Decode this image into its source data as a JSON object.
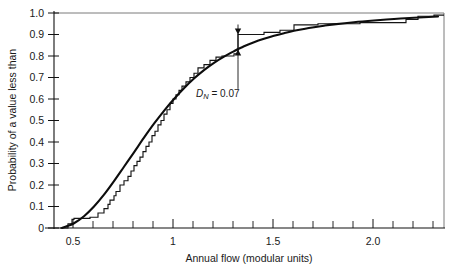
{
  "chart_data": {
    "type": "line",
    "title": "",
    "xlabel": "Annual flow (modular units)",
    "ylabel": "Probability of a value less than",
    "xlim": [
      0.4,
      2.35
    ],
    "ylim": [
      0,
      1.0
    ],
    "grid": false,
    "legend_position": "none",
    "x_ticks_major": [
      0.5,
      1,
      1.5,
      2.0
    ],
    "x_tick_labels": [
      "0.5",
      "1",
      "1.5",
      "2.0"
    ],
    "x_ticks_minor": [
      0.6,
      0.7,
      0.8,
      0.9,
      1.1,
      1.2,
      1.3,
      1.4,
      1.6,
      1.7,
      1.8,
      1.9,
      2.1,
      2.2,
      2.3
    ],
    "y_ticks": [
      0,
      0.1,
      0.2,
      0.3,
      0.4,
      0.5,
      0.6,
      0.7,
      0.8,
      0.9,
      1.0
    ],
    "y_tick_labels": [
      "0",
      "0.1",
      "0.2",
      "0.3",
      "0.4",
      "0.5",
      "0.6",
      "0.7",
      "0.8",
      "0.9",
      "1.0"
    ],
    "series": [
      {
        "name": "Empirical step CDF (sample)",
        "type": "step",
        "x": [
          0.47,
          0.49,
          0.5,
          0.58,
          0.62,
          0.65,
          0.67,
          0.68,
          0.7,
          0.71,
          0.73,
          0.75,
          0.77,
          0.785,
          0.8,
          0.815,
          0.83,
          0.845,
          0.86,
          0.875,
          0.89,
          0.905,
          0.92,
          0.935,
          0.95,
          0.965,
          0.98,
          0.995,
          1.01,
          1.025,
          1.04,
          1.06,
          1.08,
          1.1,
          1.12,
          1.15,
          1.18,
          1.21,
          1.24,
          1.3,
          1.32,
          1.45,
          1.53,
          1.6,
          1.72,
          1.93,
          2.16,
          2.22,
          2.3
        ],
        "y": [
          0.02,
          0.04,
          0.045,
          0.05,
          0.07,
          0.09,
          0.11,
          0.13,
          0.15,
          0.17,
          0.2,
          0.22,
          0.24,
          0.265,
          0.29,
          0.31,
          0.33,
          0.355,
          0.38,
          0.4,
          0.43,
          0.45,
          0.48,
          0.5,
          0.53,
          0.55,
          0.58,
          0.6,
          0.62,
          0.64,
          0.66,
          0.68,
          0.7,
          0.72,
          0.745,
          0.76,
          0.78,
          0.795,
          0.8,
          0.81,
          0.9,
          0.91,
          0.92,
          0.945,
          0.95,
          0.955,
          0.97,
          0.985,
          0.99
        ]
      },
      {
        "name": "Fitted theoretical distribution",
        "type": "line",
        "x": [
          0.44,
          0.47,
          0.5,
          0.55,
          0.6,
          0.65,
          0.7,
          0.75,
          0.8,
          0.85,
          0.9,
          0.95,
          1.0,
          1.05,
          1.1,
          1.15,
          1.2,
          1.25,
          1.3,
          1.35,
          1.4,
          1.45,
          1.5,
          1.55,
          1.6,
          1.65,
          1.7,
          1.75,
          1.8,
          1.9,
          2.0,
          2.1,
          2.2,
          2.32
        ],
        "y": [
          0.0,
          0.01,
          0.022,
          0.055,
          0.1,
          0.155,
          0.218,
          0.285,
          0.352,
          0.42,
          0.485,
          0.545,
          0.6,
          0.65,
          0.695,
          0.734,
          0.768,
          0.797,
          0.822,
          0.845,
          0.864,
          0.88,
          0.894,
          0.906,
          0.917,
          0.926,
          0.934,
          0.941,
          0.947,
          0.957,
          0.965,
          0.972,
          0.978,
          0.984
        ]
      }
    ],
    "annotations": [
      {
        "name": "max-deviation",
        "label_prefix": "D",
        "label_sub": "N",
        "label_suffix": " = 0.07",
        "x": 1.32,
        "y_low": 0.83,
        "y_high": 0.9,
        "value": 0.07,
        "leader_text_x": 1.3,
        "leader_text_y": 0.675
      }
    ]
  }
}
